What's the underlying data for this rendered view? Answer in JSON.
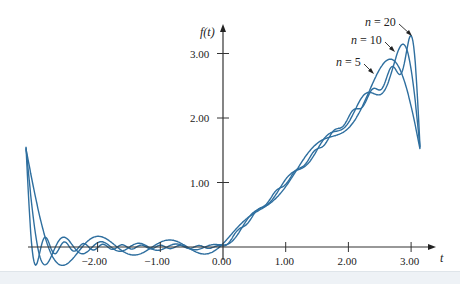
{
  "chart_data": {
    "type": "line",
    "title": "",
    "xlabel": "t",
    "ylabel": "f(t)",
    "xlim": [
      -3.14159,
      3.14159
    ],
    "ylim": [
      -0.2,
      3.3
    ],
    "grid": false,
    "x_ticks": [
      "-2.00",
      "-1.00",
      "0.00",
      "1.00",
      "2.00",
      "3.00"
    ],
    "x_tick_values": [
      -2,
      -1,
      0,
      1,
      2,
      3
    ],
    "y_ticks": [
      "1.00",
      "2.00",
      "3.00"
    ],
    "y_tick_values": [
      1,
      2,
      3
    ],
    "function": "Fourier partial sums of f(t)=0 for -pi<t<0, f(t)=t for 0<t<pi",
    "series": [
      {
        "name": "n = 5",
        "terms": 5
      },
      {
        "name": "n = 10",
        "terms": 10
      },
      {
        "name": "n = 20",
        "terms": 20
      }
    ],
    "annotations": [
      {
        "text": "n = 20",
        "arrow_to_t": 2.95
      },
      {
        "text": "n = 10",
        "arrow_to_t": 2.75
      },
      {
        "text": "n = 5",
        "arrow_to_t": 2.45
      }
    ],
    "line_color": "#2f6f9f",
    "legend_position": "annotations near peaks"
  },
  "labels": {
    "x_axis": "t",
    "y_axis": "f(t)",
    "n20": "n = 20",
    "n10": "n = 10",
    "n5": "n = 5"
  }
}
